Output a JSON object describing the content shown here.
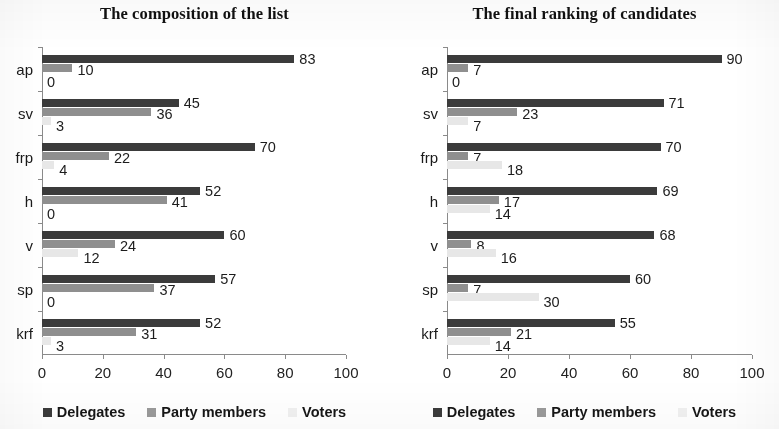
{
  "chart_data": [
    {
      "type": "bar",
      "orientation": "horizontal",
      "title": "The composition of the list",
      "xlabel": "",
      "ylabel": "",
      "xlim": [
        0,
        100
      ],
      "xticks": [
        0,
        20,
        40,
        60,
        80,
        100
      ],
      "grid": false,
      "legend_position": "bottom",
      "categories": [
        "ap",
        "sv",
        "frp",
        "h",
        "v",
        "sp",
        "krf"
      ],
      "series": [
        {
          "name": "Delegates",
          "color": "#3b3b3b",
          "values": [
            83,
            45,
            70,
            52,
            60,
            57,
            52
          ]
        },
        {
          "name": "Party members",
          "color": "#8f8f8f",
          "values": [
            10,
            36,
            22,
            41,
            24,
            37,
            31
          ]
        },
        {
          "name": "Voters",
          "color": "#e7e7e7",
          "values": [
            0,
            3,
            4,
            0,
            12,
            0,
            3
          ]
        }
      ]
    },
    {
      "type": "bar",
      "orientation": "horizontal",
      "title": "The final ranking of candidates",
      "xlabel": "",
      "ylabel": "",
      "xlim": [
        0,
        100
      ],
      "xticks": [
        0,
        20,
        40,
        60,
        80,
        100
      ],
      "grid": false,
      "legend_position": "bottom",
      "categories": [
        "ap",
        "sv",
        "frp",
        "h",
        "v",
        "sp",
        "krf"
      ],
      "series": [
        {
          "name": "Delegates",
          "color": "#3b3b3b",
          "values": [
            90,
            71,
            70,
            69,
            68,
            60,
            55
          ]
        },
        {
          "name": "Party members",
          "color": "#8f8f8f",
          "values": [
            7,
            23,
            7,
            17,
            8,
            7,
            21
          ]
        },
        {
          "name": "Voters",
          "color": "#e7e7e7",
          "values": [
            0,
            7,
            18,
            14,
            16,
            30,
            14
          ]
        }
      ]
    }
  ],
  "panels": [
    {
      "title": "The composition of the list",
      "legend": [
        "Delegates",
        "Party members",
        "Voters"
      ],
      "xticks": [
        "0",
        "20",
        "40",
        "60",
        "80",
        "100"
      ],
      "categories": [
        "ap",
        "sv",
        "frp",
        "h",
        "v",
        "sp",
        "krf"
      ],
      "labels": {
        "ap": [
          "83",
          "10",
          "0"
        ],
        "sv": [
          "45",
          "36",
          "3"
        ],
        "frp": [
          "70",
          "22",
          "4"
        ],
        "h": [
          "52",
          "41",
          "0"
        ],
        "v": [
          "60",
          "24",
          "12"
        ],
        "sp": [
          "57",
          "37",
          "0"
        ],
        "krf": [
          "52",
          "31",
          "3"
        ]
      }
    },
    {
      "title": "The final ranking of candidates",
      "legend": [
        "Delegates",
        "Party members",
        "Voters"
      ],
      "xticks": [
        "0",
        "20",
        "40",
        "60",
        "80",
        "100"
      ],
      "categories": [
        "ap",
        "sv",
        "frp",
        "h",
        "v",
        "sp",
        "krf"
      ],
      "labels": {
        "ap": [
          "90",
          "7",
          "0"
        ],
        "sv": [
          "71",
          "23",
          "7"
        ],
        "frp": [
          "70",
          "7",
          "18"
        ],
        "h": [
          "69",
          "17",
          "14"
        ],
        "v": [
          "68",
          "8",
          "16"
        ],
        "sp": [
          "60",
          "7",
          "30"
        ],
        "krf": [
          "55",
          "21",
          "14"
        ]
      }
    }
  ]
}
